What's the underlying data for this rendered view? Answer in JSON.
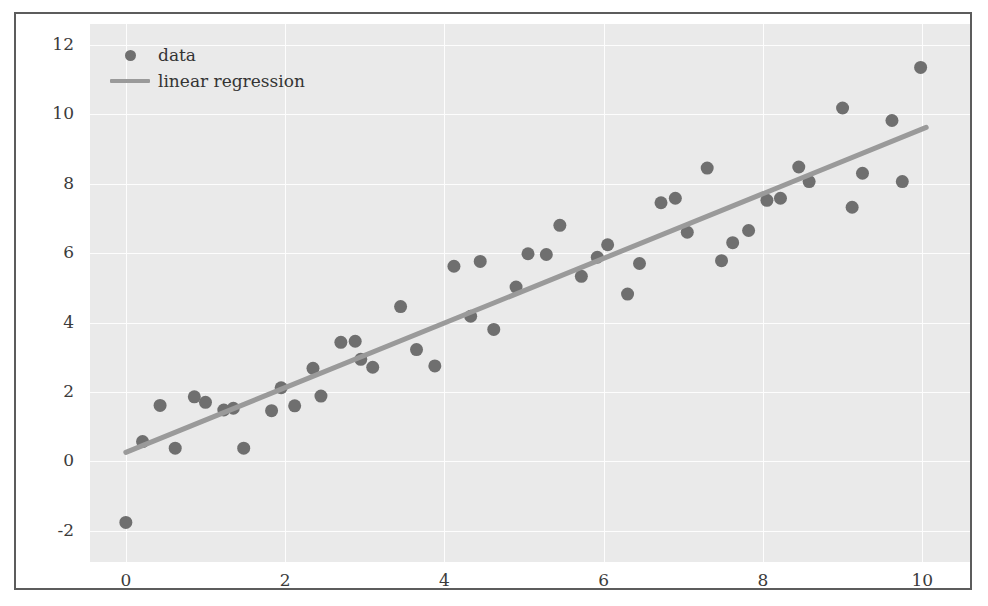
{
  "chart_data": {
    "type": "scatter",
    "title": "",
    "xlabel": "",
    "ylabel": "",
    "xlim": [
      -0.45,
      10.6
    ],
    "ylim": [
      -2.9,
      12.6
    ],
    "xticks": [
      0,
      2,
      4,
      6,
      8,
      10
    ],
    "yticks": [
      -2,
      0,
      2,
      4,
      6,
      8,
      10,
      12
    ],
    "xtick_labels": [
      "0",
      "2",
      "4",
      "6",
      "8",
      "10"
    ],
    "ytick_labels": [
      "-2",
      "0",
      "2",
      "4",
      "6",
      "8",
      "10",
      "12"
    ],
    "grid": true,
    "legend_position": "upper left",
    "legend": [
      {
        "label": "data",
        "marker": "circle",
        "color": "#6f6f6f"
      },
      {
        "label": "linear regression",
        "marker": "line",
        "color": "#9a9a9a"
      }
    ],
    "series": [
      {
        "name": "data",
        "type": "scatter",
        "color": "#6f6f6f",
        "marker_size": 13,
        "points": [
          [
            0.0,
            -1.76
          ],
          [
            0.21,
            0.57
          ],
          [
            0.43,
            1.61
          ],
          [
            0.62,
            0.38
          ],
          [
            0.86,
            1.86
          ],
          [
            1.0,
            1.7
          ],
          [
            1.23,
            1.48
          ],
          [
            1.35,
            1.53
          ],
          [
            1.48,
            0.38
          ],
          [
            1.83,
            1.46
          ],
          [
            1.95,
            2.12
          ],
          [
            2.12,
            1.6
          ],
          [
            2.35,
            2.68
          ],
          [
            2.45,
            1.88
          ],
          [
            2.7,
            3.43
          ],
          [
            2.88,
            3.46
          ],
          [
            2.95,
            2.94
          ],
          [
            3.1,
            2.71
          ],
          [
            3.45,
            4.46
          ],
          [
            3.65,
            3.22
          ],
          [
            3.88,
            2.75
          ],
          [
            4.12,
            5.62
          ],
          [
            4.33,
            4.18
          ],
          [
            4.45,
            5.76
          ],
          [
            4.62,
            3.8
          ],
          [
            4.9,
            5.02
          ],
          [
            5.05,
            5.98
          ],
          [
            5.28,
            5.96
          ],
          [
            5.45,
            6.8
          ],
          [
            5.72,
            5.33
          ],
          [
            5.92,
            5.88
          ],
          [
            6.05,
            6.24
          ],
          [
            6.3,
            4.82
          ],
          [
            6.45,
            5.7
          ],
          [
            6.72,
            7.45
          ],
          [
            6.9,
            7.58
          ],
          [
            7.05,
            6.6
          ],
          [
            7.3,
            8.45
          ],
          [
            7.48,
            5.78
          ],
          [
            7.62,
            6.3
          ],
          [
            7.82,
            6.65
          ],
          [
            8.05,
            7.52
          ],
          [
            8.22,
            7.58
          ],
          [
            8.45,
            8.48
          ],
          [
            8.58,
            8.06
          ],
          [
            9.0,
            10.18
          ],
          [
            9.12,
            7.32
          ],
          [
            9.25,
            8.3
          ],
          [
            9.62,
            9.82
          ],
          [
            9.75,
            8.06
          ],
          [
            9.98,
            11.35
          ]
        ]
      },
      {
        "name": "linear regression",
        "type": "line",
        "color": "#9a9a9a",
        "line_width": 5,
        "endpoints": [
          [
            0.0,
            0.26
          ],
          [
            10.05,
            9.62
          ]
        ],
        "slope": 0.93,
        "intercept": 0.26
      }
    ]
  }
}
